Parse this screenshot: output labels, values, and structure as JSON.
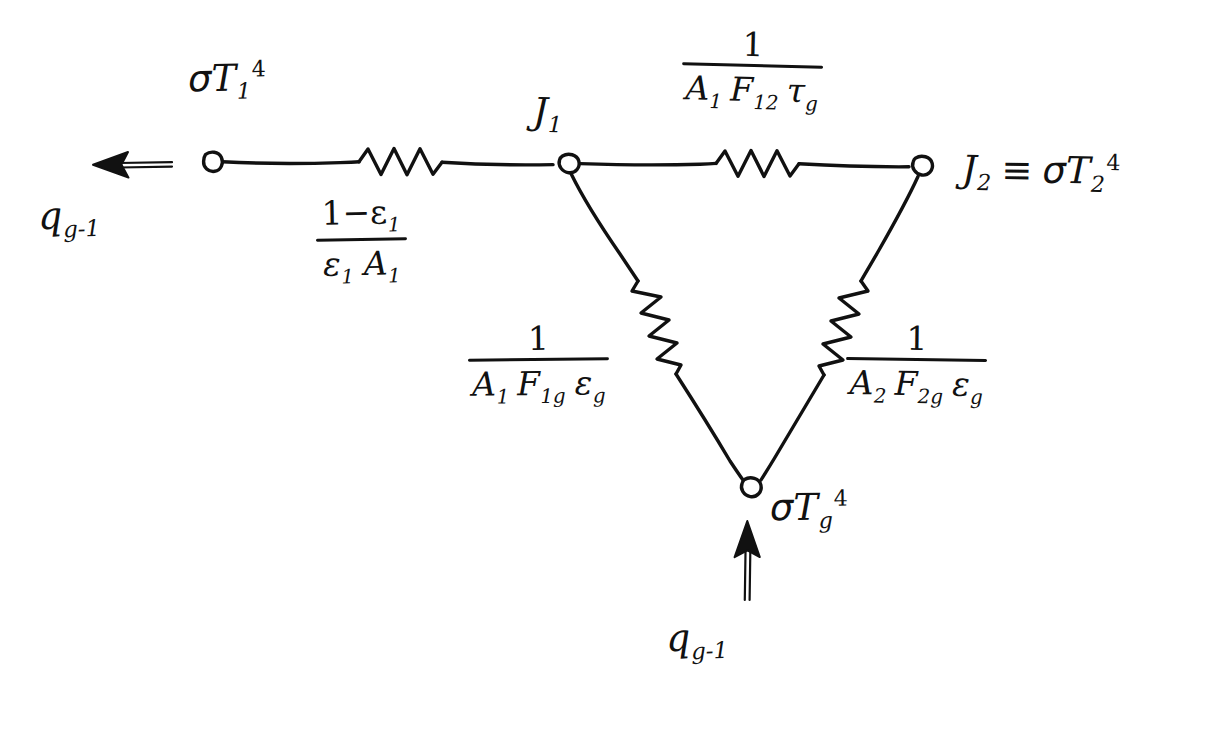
{
  "diagram": {
    "ink_color": "#111111",
    "background_color": "#ffffff"
  },
  "nodes": {
    "surface1": {
      "label_sigma": "σ",
      "label_T": "T",
      "sub": "1",
      "sup": "4"
    },
    "j1": {
      "letter": "J",
      "sub": "1"
    },
    "j2": {
      "letter": "J",
      "identity": "≡",
      "sigma": "σ",
      "T": "T",
      "sub": "2",
      "sup": "4"
    },
    "gas": {
      "sigma": "σ",
      "T": "T",
      "sub": "g",
      "sup": "4"
    }
  },
  "flows": {
    "left": {
      "letter": "q",
      "sub": "g-1"
    },
    "bottom": {
      "letter": "q",
      "sub": "g-1"
    }
  },
  "resistors": {
    "surface_resistance_1": {
      "numerator": "1−ε",
      "numerator_sub": "1",
      "den_eps": "ε",
      "den_eps_sub": "1",
      "den_A": "A",
      "den_A_sub": "1"
    },
    "space_resistance_12": {
      "numerator": "1",
      "den_A": "A",
      "den_A_sub": "1",
      "den_F": "F",
      "den_F_sub": "12",
      "den_tau": "τ",
      "den_tau_sub": "g"
    },
    "gas_resistance_1g": {
      "numerator": "1",
      "den_A": "A",
      "den_A_sub": "1",
      "den_F": "F",
      "den_F_sub": "1g",
      "den_eps": "ε",
      "den_eps_sub": "g"
    },
    "gas_resistance_2g": {
      "numerator": "1",
      "den_A": "A",
      "den_A_sub": "2",
      "den_F": "F",
      "den_F_sub": "2g",
      "den_eps": "ε",
      "den_eps_sub": "g"
    }
  }
}
